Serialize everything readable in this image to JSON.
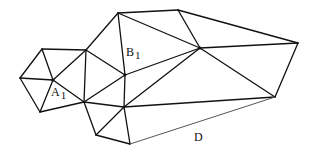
{
  "diagram": {
    "labels": {
      "a1": {
        "main": "A",
        "sub": "1"
      },
      "b1": {
        "main": "B",
        "sub": "1"
      },
      "d": {
        "main": "D"
      }
    },
    "colors": {
      "stroke": "#111111",
      "dashed_edge": "#555555",
      "background": "#ffffff"
    }
  }
}
